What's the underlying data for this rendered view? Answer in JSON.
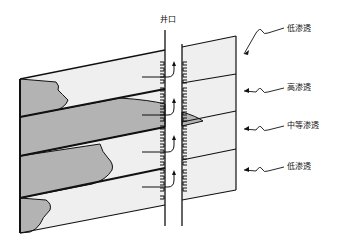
{
  "figure": {
    "well_label": "井口",
    "layers": [
      {
        "label": "低渗透",
        "permeability": "low"
      },
      {
        "label": "高渗透",
        "permeability": "high"
      },
      {
        "label": "中等渗透",
        "permeability": "medium"
      },
      {
        "label": "低渗透",
        "permeability": "low"
      }
    ],
    "colors": {
      "background": "#ffffff",
      "panel_fill": "#efefef",
      "front_fill": "#b3b3b3",
      "stroke": "#111111"
    }
  }
}
